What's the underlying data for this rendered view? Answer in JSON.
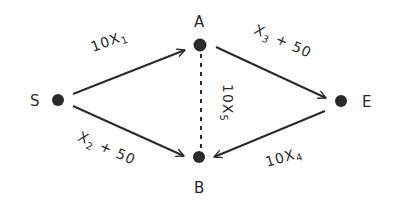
{
  "diagram": {
    "type": "directed network graph (hand-drawn)",
    "colors": {
      "stroke": "#2a2a2a",
      "node": "#2a2a2a",
      "background": "#ffffff"
    },
    "nodes": [
      {
        "id": "S",
        "label": "S"
      },
      {
        "id": "A",
        "label": "A"
      },
      {
        "id": "E",
        "label": "E"
      },
      {
        "id": "B",
        "label": "B"
      }
    ],
    "edges": [
      {
        "from": "S",
        "to": "A",
        "style": "solid-arrow",
        "label": {
          "main": "10X",
          "sub": "1",
          "tail": ""
        }
      },
      {
        "from": "S",
        "to": "B",
        "style": "solid-arrow",
        "label": {
          "main": "X",
          "sub": "2",
          "tail": " + 50"
        }
      },
      {
        "from": "A",
        "to": "E",
        "style": "solid-arrow",
        "label": {
          "main": "X",
          "sub": "3",
          "tail": " + 50"
        }
      },
      {
        "from": "E",
        "to": "B",
        "style": "solid-arrow",
        "label": {
          "main": "10X",
          "sub": "4",
          "tail": ""
        }
      },
      {
        "from": "A",
        "to": "B",
        "style": "dashed-undirected",
        "label": {
          "main": "10X",
          "sub": "5",
          "tail": ""
        }
      }
    ]
  }
}
